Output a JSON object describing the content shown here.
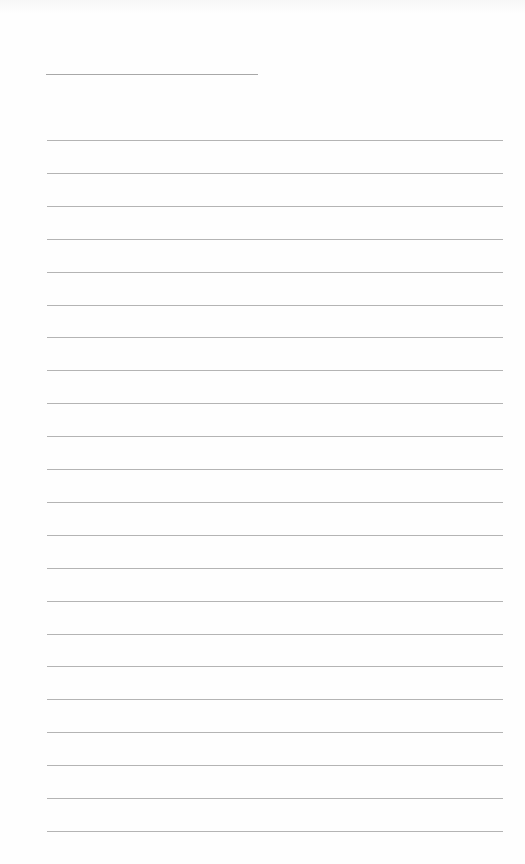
{
  "page": {
    "type": "lined-paper",
    "background_color": "#ffffff",
    "line_color": "#b4b4b4"
  },
  "header_line": {
    "label": "",
    "x": 46,
    "y": 74,
    "width": 212
  },
  "ruled_lines": {
    "count": 22,
    "first_y": 140,
    "spacing": 32.9,
    "x": 47,
    "width": 456,
    "entries": [
      "",
      "",
      "",
      "",
      "",
      "",
      "",
      "",
      "",
      "",
      "",
      "",
      "",
      "",
      "",
      "",
      "",
      "",
      "",
      "",
      "",
      ""
    ]
  }
}
